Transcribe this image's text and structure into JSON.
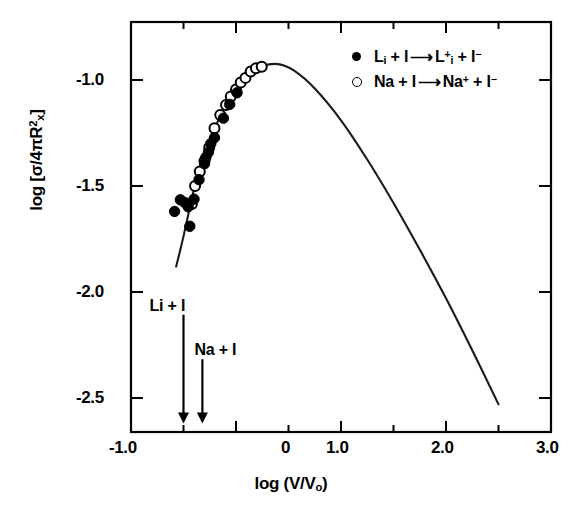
{
  "chart_data": {
    "type": "scatter",
    "title": "",
    "xlabel": "log (V/Vₒ)",
    "ylabel": "log [σ/4πR²ₓ]",
    "xlim": [
      -1.25,
      3.0
    ],
    "ylim": [
      -2.65,
      -0.72
    ],
    "grid": false,
    "legend_position": "top-right",
    "xticks": [
      -1.0,
      -0.5,
      0.0,
      0.5,
      1.0,
      1.5,
      2.0,
      2.5,
      3.0
    ],
    "xtick_labels": [
      "-1.0",
      "",
      "0",
      "",
      "1.0",
      "",
      "2.0",
      "",
      "3.0"
    ],
    "yticks": [
      -1.0,
      -1.5,
      -2.0,
      -2.5
    ],
    "ytick_labels": [
      "-1.0",
      "-1.5",
      "-2.0",
      "-2.5"
    ],
    "series": [
      {
        "name": "Li + I → Li⁺ + I⁻",
        "marker": "filled-circle",
        "color": "#000000",
        "points": [
          [
            -0.585,
            -1.62
          ],
          [
            -0.53,
            -1.565
          ],
          [
            -0.487,
            -1.578
          ],
          [
            -0.455,
            -1.598
          ],
          [
            -0.44,
            -1.69
          ],
          [
            -0.4,
            -1.562
          ],
          [
            -0.352,
            -1.47
          ],
          [
            -0.3,
            -1.395
          ],
          [
            -0.287,
            -1.365
          ],
          [
            -0.262,
            -1.34
          ],
          [
            -0.24,
            -1.3
          ],
          [
            -0.205,
            -1.272
          ],
          [
            -0.12,
            -1.18
          ],
          [
            -0.06,
            -1.115
          ],
          [
            0.01,
            -1.06
          ]
        ]
      },
      {
        "name": "Na + I → Na⁺ + I⁻",
        "marker": "open-circle",
        "color": "#000000",
        "points": [
          [
            -0.42,
            -1.585
          ],
          [
            -0.39,
            -1.5
          ],
          [
            -0.345,
            -1.432
          ],
          [
            -0.3,
            -1.382
          ],
          [
            -0.255,
            -1.318
          ],
          [
            -0.205,
            -1.228
          ],
          [
            -0.15,
            -1.165
          ],
          [
            -0.095,
            -1.118
          ],
          [
            -0.05,
            -1.078
          ],
          [
            0.0,
            -1.045
          ],
          [
            0.045,
            -1.012
          ],
          [
            0.09,
            -0.99
          ],
          [
            0.14,
            -0.96
          ],
          [
            0.19,
            -0.945
          ],
          [
            0.245,
            -0.938
          ]
        ]
      }
    ],
    "fit_curve": {
      "name": "model curve",
      "x": [
        -0.57,
        -0.52,
        -0.47,
        -0.43,
        -0.39,
        -0.34,
        -0.28,
        -0.2,
        -0.1,
        0.0,
        0.12,
        0.25,
        0.4,
        0.55,
        0.75,
        1.0,
        1.25,
        1.5,
        1.75,
        2.0,
        2.25,
        2.5
      ],
      "y": [
        -1.88,
        -1.78,
        -1.67,
        -1.58,
        -1.495,
        -1.42,
        -1.33,
        -1.225,
        -1.12,
        -1.04,
        -0.975,
        -0.935,
        -0.925,
        -0.955,
        -1.04,
        -1.19,
        -1.375,
        -1.58,
        -1.8,
        -2.03,
        -2.275,
        -2.53
      ]
    },
    "annotations": [
      {
        "text": "Li + I",
        "x": -0.5,
        "arrow_to_y": -2.62,
        "label_at_y": -2.06
      },
      {
        "text": "Na + I",
        "x": -0.32,
        "arrow_to_y": -2.62,
        "label_at_y": -2.27
      }
    ]
  },
  "axes": {
    "ylabel_parts": {
      "pre": "log [",
      "sigma": "σ",
      "mid": "/4",
      "pi": "π",
      "r": "R",
      "sub": "x",
      "sup": "2",
      "post": "]"
    },
    "xlabel_parts": {
      "pre": "log (V/V",
      "sub": "o",
      "post": ")"
    },
    "xtick_1": "-1.0",
    "xtick_2": "0",
    "xtick_3": "1.0",
    "xtick_4": "2.0",
    "xtick_5": "3.0",
    "ytick_1": "-1.0",
    "ytick_2": "-1.5",
    "ytick_3": "-2.0",
    "ytick_4": "-2.5"
  },
  "legend": {
    "row1": {
      "reactant_a": "L",
      "reactant_a_sub": "i",
      "plus1": "+ I",
      "arrow": "⟶",
      "product_a": "L",
      "product_a_sub": "i",
      "product_a_sup": "+",
      "plus2": "+ I",
      "product_b_sup": "−"
    },
    "row2": {
      "reactant_a": "Na",
      "plus1": "+ I",
      "arrow": "⟶",
      "product_a": "Na",
      "product_a_sup": "+",
      "plus2": "+ I",
      "product_b_sup": "−"
    }
  },
  "annotations": {
    "arrow_label_li": "Li + I",
    "arrow_label_na": "Na + I"
  },
  "colors": {
    "axis": "#000000",
    "curve": "#1a1a1a",
    "marker_filled": "#000000",
    "marker_open_stroke": "#000000",
    "background": "#ffffff"
  }
}
